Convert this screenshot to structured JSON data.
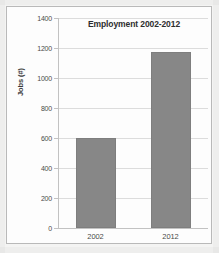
{
  "chart_data": {
    "type": "bar",
    "title": "Employment 2002-2012",
    "xlabel": "",
    "ylabel": "Jobs (#)",
    "categories": [
      "2002",
      "2012"
    ],
    "values": [
      600,
      1175
    ],
    "series": [
      {
        "name": "Jobs",
        "values": [
          600,
          1175
        ],
        "color": "#878787"
      }
    ],
    "ylim": [
      0,
      1400
    ],
    "ytick_step": 200,
    "yticks": [
      0,
      200,
      400,
      600,
      800,
      1000,
      1200,
      1400
    ],
    "ytick_labels": [
      "0",
      "200",
      "400",
      "600",
      "800",
      "1000",
      "1200",
      "1400"
    ],
    "grid": true,
    "legend": false,
    "legend_position": "none"
  },
  "figure": {
    "frame_visible": true,
    "background_color": "#fdfdfd",
    "bar_color": "#878787",
    "gridline_color": "#dcdcdc",
    "axis_color": "#c2c2c2",
    "text_color": "#4a4a4a"
  }
}
